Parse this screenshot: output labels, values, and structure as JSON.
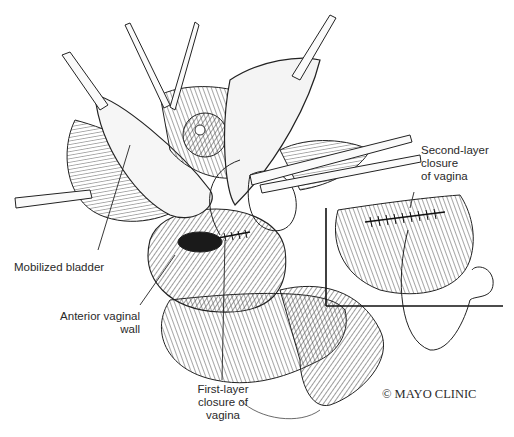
{
  "figure": {
    "labels": {
      "mobilized_bladder": "Mobilized bladder",
      "anterior_vaginal_wall_line1": "Anterior vaginal",
      "anterior_vaginal_wall_line2": "wall",
      "first_layer_line1": "First-layer",
      "first_layer_line2": "closure of",
      "first_layer_line3": "vagina",
      "second_layer_line1": "Second-layer",
      "second_layer_line2": "closure",
      "second_layer_line3": "of vagina"
    },
    "copyright": "© MAYO CLINIC",
    "colors": {
      "ink": "#2a2a2a",
      "background": "#ffffff"
    }
  }
}
